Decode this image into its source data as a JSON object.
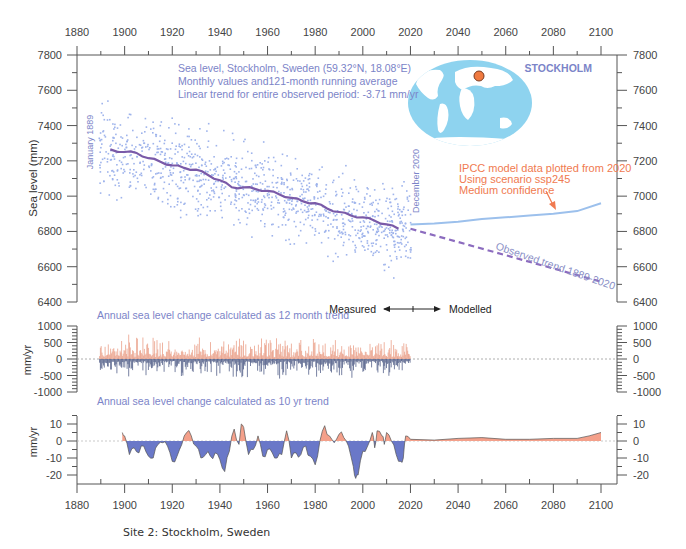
{
  "chart_data": [
    {
      "id": "sea-level",
      "type": "scatter",
      "title": "Sea level, Stockholm, Sweden (59.32°N, 18.08°E)",
      "subtitle_lines": [
        "Sea level, Stockholm, Sweden (59.32°N, 18.08°E)",
        "Monthly values and121-month running average",
        "Linear trend for entire observed period: -3.71 mm/yr"
      ],
      "station_label": "STOCKHOLM",
      "xlabel": "",
      "ylabel": "Sea level (mm)",
      "xlim": [
        1880,
        2110
      ],
      "ylim": [
        6400,
        7800
      ],
      "xticks": [
        1880,
        1900,
        1920,
        1940,
        1960,
        1980,
        2000,
        2020,
        2040,
        2060,
        2080,
        2100
      ],
      "yticks": [
        6400,
        6600,
        6800,
        7000,
        7200,
        7400,
        7600,
        7800
      ],
      "grid": false,
      "scatter_approximated": true,
      "series": [
        {
          "name": "Monthly values",
          "kind": "scatter",
          "color": "#9fb4ec",
          "x_range": [
            1889,
            2020
          ],
          "approx_center_start": 7270,
          "approx_center_end": 6810,
          "approx_spread": 350
        },
        {
          "name": "121-month running average",
          "kind": "line",
          "color": "#7a5aa8",
          "x": [
            1894,
            1900,
            1905,
            1910,
            1915,
            1920,
            1925,
            1930,
            1935,
            1940,
            1945,
            1950,
            1955,
            1960,
            1965,
            1970,
            1975,
            1980,
            1985,
            1990,
            1995,
            2000,
            2005,
            2010,
            2015
          ],
          "y": [
            7265,
            7250,
            7245,
            7215,
            7195,
            7175,
            7160,
            7150,
            7120,
            7090,
            7050,
            7050,
            7040,
            7030,
            7010,
            6990,
            6970,
            6960,
            6930,
            6910,
            6890,
            6880,
            6860,
            6840,
            6815
          ]
        },
        {
          "name": "Observed trend 1889-2020",
          "kind": "line",
          "style": "dashed",
          "color": "#8c6cbf",
          "x": [
            2020,
            2100
          ],
          "y": [
            6815,
            6515
          ]
        },
        {
          "name": "IPCC model ssp245",
          "kind": "line",
          "color": "#9cc0ec",
          "x": [
            2020,
            2030,
            2040,
            2050,
            2060,
            2070,
            2080,
            2090,
            2100
          ],
          "y": [
            6840,
            6845,
            6855,
            6870,
            6880,
            6890,
            6900,
            6915,
            6960
          ]
        }
      ],
      "annotations": {
        "start_label": "January 1889",
        "end_label": "December 2020",
        "ipcc_lines": [
          "IPCC model data plotted from 2020",
          "Using scenario ssp245",
          "Medium confidence"
        ],
        "trend_label": "Observed trend 1889-2020",
        "measured_label": "Measured",
        "modelled_label": "Modelled"
      }
    },
    {
      "id": "annual-12-month",
      "type": "bar",
      "title": "Annual sea level change calculated as 12 month trend",
      "ylabel": "mm/yr",
      "xlim": [
        1880,
        2110
      ],
      "ylim": [
        -1000,
        1000
      ],
      "yticks": [
        1000,
        500,
        0,
        -500,
        -1000
      ],
      "x_range": [
        1889,
        2020
      ],
      "approx_range": [
        -600,
        700
      ],
      "bars_approximated": true,
      "colors": {
        "positive": "#e8937a",
        "negative": "#3c4a78"
      }
    },
    {
      "id": "annual-10-yr",
      "type": "area",
      "title": "Annual sea level change calculated as 10 yr trend",
      "ylabel": "mm/yr",
      "xlim": [
        1880,
        2110
      ],
      "ylim": [
        -25,
        15
      ],
      "yticks": [
        10,
        0,
        -10,
        -20
      ],
      "xticks": [
        1880,
        1900,
        1920,
        1940,
        1960,
        1980,
        2000,
        2020,
        2040,
        2060,
        2080,
        2100
      ],
      "area_approximated": true,
      "x": [
        1899,
        1900,
        1902,
        1904,
        1906,
        1908,
        1910,
        1912,
        1914,
        1916,
        1918,
        1920,
        1922,
        1924,
        1926,
        1928,
        1930,
        1932,
        1934,
        1936,
        1938,
        1940,
        1942,
        1944,
        1946,
        1948,
        1949,
        1950,
        1952,
        1954,
        1956,
        1958,
        1960,
        1962,
        1964,
        1966,
        1968,
        1970,
        1972,
        1974,
        1976,
        1978,
        1980,
        1982,
        1984,
        1986,
        1988,
        1990,
        1992,
        1994,
        1996,
        1997,
        1998,
        2000,
        2002,
        2004,
        2005,
        2006,
        2008,
        2009,
        2010,
        2012,
        2014,
        2016,
        2017,
        2018,
        2020,
        2030,
        2040,
        2050,
        2060,
        2070,
        2080,
        2090,
        2095,
        2100
      ],
      "y": [
        5,
        3,
        -8,
        -4,
        -7,
        -3,
        -9,
        -10,
        -2,
        -1,
        -3,
        -12,
        -9,
        -2,
        5,
        3,
        -3,
        -10,
        -8,
        -9,
        -7,
        -11,
        -18,
        -6,
        7,
        -2,
        10,
        8,
        -8,
        -5,
        3,
        -9,
        -5,
        -7,
        -10,
        -8,
        6,
        -10,
        -7,
        -8,
        -3,
        -9,
        -14,
        0,
        9,
        3,
        -1,
        4,
        2,
        -3,
        -15,
        -22,
        -20,
        -6,
        -3,
        5,
        -4,
        6,
        3,
        -2,
        5,
        0,
        -8,
        -12,
        -10,
        3,
        1,
        0.5,
        1.5,
        2,
        1,
        1,
        1.5,
        1.5,
        3,
        5
      ],
      "colors": {
        "positive": "#f08060",
        "negative": "#5a6ac0"
      }
    }
  ],
  "footer": {
    "caption": "Site 2: Stockholm, Sweden"
  },
  "map": {
    "icon": "world-map-icon",
    "marker": "location-marker-icon",
    "marker_color": "#f07a40",
    "ocean_color": "#8ed3ef"
  }
}
